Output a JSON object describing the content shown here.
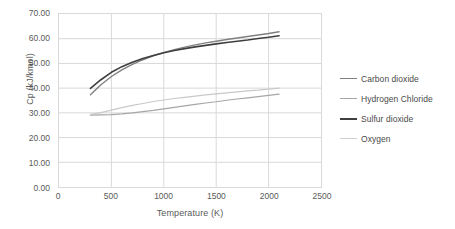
{
  "chart_data": {
    "type": "line",
    "title": "",
    "xlabel": "Temperature (K)",
    "ylabel": "Cp (kJ/kmol)",
    "xlim": [
      0,
      2500
    ],
    "ylim": [
      0,
      70
    ],
    "xticks": [
      0,
      500,
      1000,
      1500,
      2000,
      2500
    ],
    "xtick_labels": [
      "0",
      "500",
      "1000",
      "1500",
      "2000",
      "2500"
    ],
    "yticks": [
      0,
      10,
      20,
      30,
      40,
      50,
      60,
      70
    ],
    "ytick_labels": [
      "0.00",
      "10.00",
      "20.00",
      "30.00",
      "40.00",
      "50.00",
      "60.00",
      "70.00"
    ],
    "grid": "horizontal-and-vertical",
    "legend_position": "right",
    "x": [
      300,
      400,
      500,
      600,
      700,
      800,
      900,
      1000,
      1100,
      1200,
      1300,
      1400,
      1500,
      1600,
      1700,
      1800,
      1900,
      2000,
      2100
    ],
    "series": [
      {
        "name": "Carbon dioxide",
        "color": "#808080",
        "width": 1.4,
        "values": [
          37.3,
          41.4,
          44.7,
          47.4,
          49.6,
          51.5,
          53.1,
          54.4,
          55.6,
          56.6,
          57.5,
          58.3,
          59.0,
          59.7,
          60.3,
          60.9,
          61.5,
          62.1,
          62.8
        ]
      },
      {
        "name": "Hydrogen Chloride",
        "color": "#a6a6a6",
        "width": 1.2,
        "values": [
          29.1,
          29.2,
          29.3,
          29.6,
          30.0,
          30.5,
          31.0,
          31.6,
          32.2,
          32.8,
          33.4,
          34.0,
          34.5,
          35.1,
          35.6,
          36.1,
          36.6,
          37.1,
          37.6
        ]
      },
      {
        "name": "Sulfur dioxide",
        "color": "#3f3f3f",
        "width": 1.6,
        "values": [
          39.9,
          43.4,
          46.4,
          48.7,
          50.5,
          52.0,
          53.2,
          54.3,
          55.2,
          56.0,
          56.7,
          57.3,
          57.9,
          58.5,
          59.0,
          59.5,
          60.1,
          60.6,
          61.2
        ]
      },
      {
        "name": "Oxygen",
        "color": "#c9c9c9",
        "width": 1.2,
        "values": [
          29.4,
          30.1,
          31.1,
          32.1,
          33.0,
          33.8,
          34.6,
          35.2,
          35.8,
          36.3,
          36.8,
          37.3,
          37.7,
          38.1,
          38.5,
          38.9,
          39.2,
          39.6,
          40.0
        ]
      }
    ]
  },
  "legend": {
    "items": [
      {
        "label": "Carbon dioxide",
        "color": "#808080",
        "thickness": "1.6px"
      },
      {
        "label": "Hydrogen Chloride",
        "color": "#a6a6a6",
        "thickness": "1.4px"
      },
      {
        "label": "Sulfur dioxide",
        "color": "#3f3f3f",
        "thickness": "2px"
      },
      {
        "label": "Oxygen",
        "color": "#cfcfcf",
        "thickness": "1.4px"
      }
    ]
  },
  "colors": {
    "grid": "#d9d9d9",
    "plot_border": "#d9d9d9",
    "text": "#5a5a5a",
    "background": "#ffffff"
  }
}
